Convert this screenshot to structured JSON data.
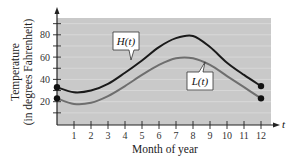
{
  "chart_data": {
    "type": "line",
    "title": "",
    "xlabel": "Month of year",
    "ylabel": "Temperature (in degrees Fahrenheit)",
    "ylabel_lines": [
      "Temperature",
      "(in degrees Fahrenheit)"
    ],
    "x_axis_variable": "t",
    "x": [
      0,
      1,
      2,
      3,
      4,
      5,
      6,
      7,
      8,
      9,
      10,
      11,
      12
    ],
    "x_ticks": [
      "1",
      "2",
      "3",
      "4",
      "5",
      "6",
      "7",
      "8",
      "9",
      "10",
      "11",
      "12"
    ],
    "y_ticks": [
      "20",
      "40",
      "60",
      "80"
    ],
    "xlim": [
      0,
      12.5
    ],
    "ylim": [
      0,
      95
    ],
    "grid": true,
    "series": [
      {
        "name": "H(t)",
        "color": "#1a1a1a",
        "values": [
          33,
          28.5,
          30,
          36,
          46,
          57,
          69,
          77,
          79,
          69,
          55,
          44,
          34
        ]
      },
      {
        "name": "L(t)",
        "color": "#6e6e6e",
        "values": [
          23,
          18,
          19,
          25,
          34,
          44,
          53,
          59,
          59,
          53,
          43,
          33,
          23
        ]
      }
    ],
    "endpoints_marked": true,
    "legend": "callout labels on curves"
  },
  "colors": {
    "plot_background": "#c9c9c9",
    "gridline": "#dcdcdc",
    "axis": "#222222"
  }
}
